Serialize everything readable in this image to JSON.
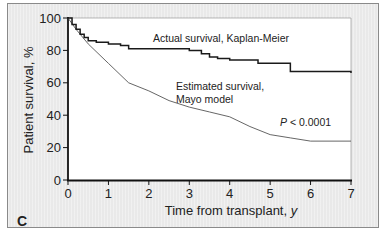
{
  "chart_data": {
    "type": "line",
    "panel_label": "C",
    "title": "",
    "xlabel": "Time from transplant, y",
    "ylabel": "Patient survival, %",
    "xlim": [
      0,
      7
    ],
    "ylim": [
      0,
      100
    ],
    "x_ticks": [
      0,
      1,
      2,
      3,
      4,
      5,
      6,
      7
    ],
    "y_ticks": [
      0,
      20,
      40,
      60,
      80,
      100
    ],
    "grid": false,
    "series": [
      {
        "name": "Actual survival, Kaplan-Meier",
        "style": "step",
        "color": "#1a1a1a",
        "x": [
          0,
          0.1,
          0.2,
          0.3,
          0.4,
          0.5,
          0.7,
          1.0,
          1.3,
          1.5,
          2.0,
          2.5,
          3.0,
          3.3,
          3.5,
          3.7,
          4.0,
          4.7,
          5.0,
          5.5,
          7.0
        ],
        "y": [
          100,
          96,
          93,
          90,
          88,
          86,
          85,
          84,
          83,
          81,
          81,
          81,
          80,
          78,
          76,
          75,
          74,
          72,
          72,
          67,
          66
        ]
      },
      {
        "name": "Estimated survival, Mayo model",
        "style": "line",
        "color": "#555555",
        "x": [
          0,
          0.2,
          0.5,
          1.0,
          1.5,
          2.0,
          2.5,
          3.0,
          3.5,
          4.0,
          4.5,
          5.0,
          5.5,
          6.0,
          7.0
        ],
        "y": [
          100,
          93,
          84,
          72,
          60,
          55,
          49,
          45,
          42,
          39,
          33,
          28,
          26,
          24,
          24
        ]
      }
    ],
    "annotations": [
      {
        "text": "Actual survival, Kaplan-Meier",
        "x": 1.4,
        "y": 88
      },
      {
        "text": "Estimated survival,",
        "x": 2.3,
        "y": 63
      },
      {
        "text": "Mayo model",
        "x": 2.3,
        "y": 56
      },
      {
        "text": "P < 0.0001",
        "x": 4.7,
        "y": 40
      }
    ]
  },
  "labels": {
    "panel_letter": "C",
    "xlabel_main": "Time from transplant, ",
    "xlabel_unit": "y",
    "ylabel": "Patient survival, %",
    "km_label": "Actual survival, Kaplan-Meier",
    "mayo_label_1": "Estimated survival,",
    "mayo_label_2": "Mayo model",
    "p_italic": "P",
    "p_rest": " < 0.0001"
  },
  "ticks": {
    "x": [
      "0",
      "1",
      "2",
      "3",
      "4",
      "5",
      "6",
      "7"
    ],
    "y": [
      "0",
      "20",
      "40",
      "60",
      "80",
      "100"
    ]
  }
}
